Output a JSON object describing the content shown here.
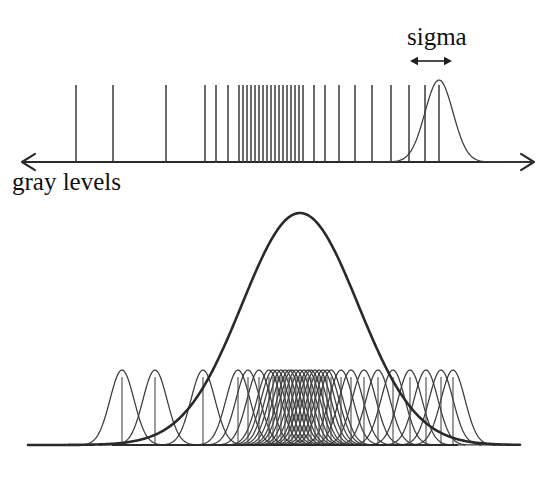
{
  "figure": {
    "title_visible": false,
    "background_color": "#ffffff",
    "ink_color": "#2b2b2b",
    "width": 546,
    "height": 477
  },
  "labels": {
    "sigma": "sigma",
    "gray_levels": "gray levels"
  },
  "top_panel": {
    "name": "gray-level-histogram-axis",
    "axis": {
      "y": 162,
      "x_start": 22,
      "x_end": 534,
      "left_arrow": true,
      "right_arrow": true,
      "arrow_size": 13
    },
    "ticks": {
      "top_y": 85,
      "baseline_y": 162,
      "x_positions": [
        76,
        113,
        166,
        205,
        216,
        228,
        239,
        243,
        247,
        251,
        255,
        259,
        263,
        267,
        271,
        275,
        279,
        283,
        287,
        291,
        295,
        299,
        303,
        314,
        325,
        339,
        355,
        372,
        391,
        409,
        425,
        439
      ],
      "count": 32
    },
    "kernel_curve": {
      "center_x": 439,
      "peak_y": 80,
      "baseline_y": 162,
      "sigma_px": 14,
      "tail_left_x": 356,
      "tail_right_x": 534
    },
    "sigma_marker": {
      "label": "sigma",
      "label_x": 407,
      "label_y": 45,
      "arrow_y": 61,
      "arrow_x_start": 410,
      "arrow_x_end": 452
    },
    "axis_label": {
      "text": "gray levels",
      "x": 12,
      "y": 190
    }
  },
  "bottom_panel": {
    "name": "kernel-density-estimate",
    "baseline": {
      "y": 445,
      "x_start": 112,
      "x_end": 458
    },
    "envelope_curve": {
      "name": "summed-density-curve",
      "center_x": 300,
      "peak_y": 213,
      "baseline_y": 445,
      "sigma_px": 58,
      "tail_left_x": 28,
      "tail_right_x": 520,
      "stroke_width": 2.6
    },
    "component_curves": {
      "peak_y": 370,
      "baseline_y": 445,
      "sigma_px": 12,
      "stroke_width": 1.25,
      "centers": [
        122,
        155,
        203,
        238,
        248,
        259,
        269,
        273,
        277,
        281,
        285,
        289,
        292,
        296,
        300,
        304,
        308,
        311,
        315,
        319,
        323,
        327,
        331,
        341,
        351,
        364,
        378,
        393,
        410,
        426,
        441,
        453
      ],
      "count": 32
    },
    "component_ticks": {
      "top_y": 377,
      "baseline_y": 445
    }
  },
  "chart_data": {
    "type": "line",
    "title": "",
    "subtitle": "",
    "xlabel": "gray levels",
    "ylabel": "",
    "grid": false,
    "legend_position": "none",
    "annotations": [
      "sigma"
    ],
    "series": [
      {
        "name": "gray level samples (top impulses)",
        "type": "impulse",
        "x": [
          76,
          113,
          166,
          205,
          216,
          228,
          239,
          243,
          247,
          251,
          255,
          259,
          263,
          267,
          271,
          275,
          279,
          283,
          287,
          291,
          295,
          299,
          303,
          314,
          325,
          339,
          355,
          372,
          391,
          409,
          425,
          439
        ],
        "values": [
          1,
          1,
          1,
          1,
          1,
          1,
          1,
          1,
          1,
          1,
          1,
          1,
          1,
          1,
          1,
          1,
          1,
          1,
          1,
          1,
          1,
          1,
          1,
          1,
          1,
          1,
          1,
          1,
          1,
          1,
          1,
          1
        ]
      },
      {
        "name": "sigma kernel on last sample",
        "type": "gaussian",
        "center": 439,
        "sigma": 14,
        "amplitude": 1
      },
      {
        "name": "component kernels (bottom)",
        "type": "gaussian-set",
        "centers": [
          122,
          155,
          203,
          238,
          248,
          259,
          269,
          273,
          277,
          281,
          285,
          289,
          292,
          296,
          300,
          304,
          308,
          311,
          315,
          319,
          323,
          327,
          331,
          341,
          351,
          364,
          378,
          393,
          410,
          426,
          441,
          453
        ],
        "sigma": 12,
        "amplitude": 0.22
      },
      {
        "name": "summed density estimate (bottom thick curve)",
        "type": "gaussian",
        "center": 300,
        "sigma": 58,
        "amplitude": 1
      }
    ],
    "xlim": [
      22,
      534
    ],
    "ylim": [
      0,
      1
    ]
  }
}
